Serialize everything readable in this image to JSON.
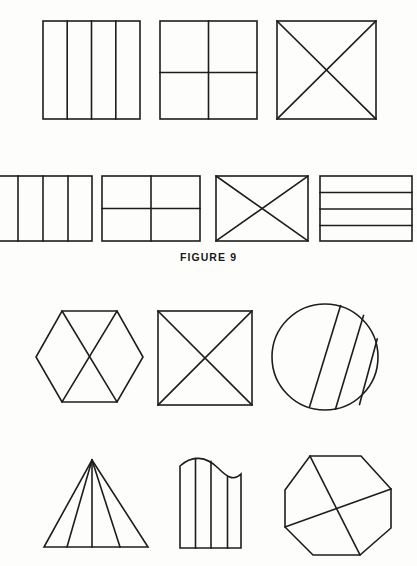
{
  "page": {
    "background_color": "#fdfdfc",
    "ink_color": "#1d1d1d",
    "width": 417,
    "height": 566
  },
  "caption": {
    "text": "FIGURE  9",
    "label": "FIGURE 9"
  },
  "figure": {
    "title": "FIGURE 9",
    "stroke_color": "#1d1d1d",
    "stroke_width": 1.6,
    "fill": "none"
  },
  "groups": [
    {
      "name": "figure-9-upper-row-1",
      "shapes": [
        {
          "name": "square-four-vertical-strips",
          "type": "rect",
          "x": 43,
          "y": 21,
          "width": 97,
          "height": 98,
          "dividers": "3 vertical lines creating 4 columns",
          "divider_x": [
            67,
            92,
            116
          ]
        },
        {
          "name": "square-quartered-grid",
          "type": "rect",
          "x": 160,
          "y": 21,
          "width": 97,
          "height": 98,
          "dividers": "1 vertical center line and 1 horizontal line",
          "divider_x": [
            208
          ],
          "divider_y": [
            73
          ]
        },
        {
          "name": "square-with-x-diagonals",
          "type": "rect",
          "x": 277,
          "y": 21,
          "width": 99,
          "height": 98,
          "dividers": "both diagonals"
        }
      ]
    },
    {
      "name": "figure-9-upper-row-2",
      "shapes": [
        {
          "name": "rectangle-four-vertical-strips-cropped",
          "type": "rect",
          "x": -8,
          "y": 176,
          "width": 100,
          "height": 65,
          "dividers": "3 vertical lines creating 4 columns",
          "divider_x": [
            18,
            43,
            68
          ]
        },
        {
          "name": "rectangle-quartered-grid",
          "type": "rect",
          "x": 102,
          "y": 176,
          "width": 98,
          "height": 65,
          "dividers": "1 vertical center line and 1 horizontal line",
          "divider_x": [
            151
          ],
          "divider_y": [
            209
          ]
        },
        {
          "name": "rectangle-with-x-diagonals",
          "type": "rect",
          "x": 216,
          "y": 176,
          "width": 92,
          "height": 65,
          "dividers": "both diagonals"
        },
        {
          "name": "rectangle-three-horizontal-bands",
          "type": "rect",
          "x": 320,
          "y": 176,
          "width": 92,
          "height": 65,
          "dividers": "3 horizontal lines creating 4 bands",
          "divider_y": [
            192,
            209,
            225
          ]
        }
      ]
    },
    {
      "name": "figure-10-lower-row-1",
      "shapes": [
        {
          "name": "hexagon-with-bowtie-diagonals",
          "type": "polygon",
          "points": "62,311 117,311 143,357 117,402 62,402 36,357",
          "dividers": "diagonals from top-left to bottom-right and top-right to bottom-left"
        },
        {
          "name": "square-with-x-diagonals",
          "type": "rect",
          "x": 158,
          "y": 311,
          "width": 94,
          "height": 94,
          "dividers": "both diagonals"
        },
        {
          "name": "circle-with-three-slanted-chords",
          "type": "circle",
          "cx": 325,
          "cy": 357,
          "r": 53,
          "dividers": "3 parallel slanted chords"
        }
      ]
    },
    {
      "name": "figure-10-lower-row-2",
      "shapes": [
        {
          "name": "triangle-with-fan-lines",
          "type": "polygon",
          "points": "92,460 148,547 44,547",
          "dividers": "3 lines fanning from apex to base"
        },
        {
          "name": "wavy-top-shape-with-vertical-lines",
          "type": "path",
          "dividers": "3 vertical lines"
        },
        {
          "name": "octagon-with-crossing-chords",
          "type": "polygon",
          "points": "310,456 361,456 391,489 391,528 360,555 313,555 285,527 285,490",
          "dividers": "2 crossing chords"
        }
      ]
    }
  ]
}
